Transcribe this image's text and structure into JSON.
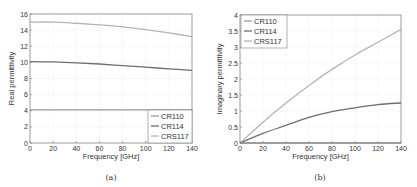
{
  "chart_data": [
    {
      "type": "line",
      "caption": "(a)",
      "title": "",
      "xlabel": "Frequency [GHz]",
      "ylabel": "Real permittivity",
      "xlim": [
        0,
        140
      ],
      "ylim": [
        0,
        16
      ],
      "xticks": [
        0,
        20,
        40,
        60,
        80,
        100,
        120,
        140
      ],
      "yticks": [
        0,
        2,
        4,
        6,
        8,
        10,
        12,
        14,
        16
      ],
      "grid": true,
      "legend_position": "bottom-right",
      "x": [
        0,
        20,
        40,
        60,
        80,
        100,
        120,
        140
      ],
      "series": [
        {
          "name": "CR110",
          "color": "#9a9a9a",
          "values": [
            4.1,
            4.1,
            4.1,
            4.1,
            4.1,
            4.1,
            4.1,
            4.1
          ]
        },
        {
          "name": "CR114",
          "color": "#6e6e6e",
          "values": [
            10.1,
            10.05,
            9.95,
            9.8,
            9.6,
            9.4,
            9.2,
            9.0
          ]
        },
        {
          "name": "CRS117",
          "color": "#b4b4b4",
          "values": [
            15.0,
            15.0,
            14.85,
            14.65,
            14.4,
            14.05,
            13.65,
            13.2
          ]
        }
      ]
    },
    {
      "type": "line",
      "caption": "(b)",
      "title": "",
      "xlabel": "Frequency [GHz]",
      "ylabel": "Imaginary permittivity",
      "xlim": [
        0,
        140
      ],
      "ylim": [
        0,
        4
      ],
      "xticks": [
        0,
        20,
        40,
        60,
        80,
        100,
        120,
        140
      ],
      "yticks": [
        0,
        0.5,
        1,
        1.5,
        2,
        2.5,
        3,
        3.5,
        4
      ],
      "grid": true,
      "legend_position": "top-left",
      "x": [
        0,
        20,
        40,
        60,
        80,
        100,
        120,
        140
      ],
      "series": [
        {
          "name": "CR110",
          "color": "#9a9a9a",
          "values": [
            0.0,
            0.0,
            0.0,
            0.0,
            0.0,
            0.0,
            0.0,
            0.0
          ]
        },
        {
          "name": "CR114",
          "color": "#6e6e6e",
          "values": [
            0.0,
            0.3,
            0.55,
            0.8,
            0.98,
            1.1,
            1.2,
            1.25
          ]
        },
        {
          "name": "CRS117",
          "color": "#b4b4b4",
          "values": [
            0.0,
            0.65,
            1.25,
            1.8,
            2.3,
            2.75,
            3.15,
            3.55
          ]
        }
      ]
    }
  ]
}
